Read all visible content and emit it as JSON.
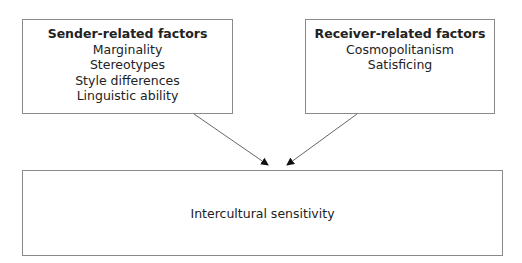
{
  "diagram": {
    "sender": {
      "title": "Sender-related factors",
      "items": [
        "Marginality",
        "Stereotypes",
        "Style differences",
        "Linguistic ability"
      ]
    },
    "receiver": {
      "title": "Receiver-related factors",
      "items": [
        "Cosmopolitanism",
        "Satisficing"
      ]
    },
    "outcome": {
      "label": "Intercultural sensitivity"
    },
    "edges": [
      {
        "from": "Sender-related factors",
        "to": "Intercultural sensitivity"
      },
      {
        "from": "Receiver-related factors",
        "to": "Intercultural sensitivity"
      }
    ]
  }
}
